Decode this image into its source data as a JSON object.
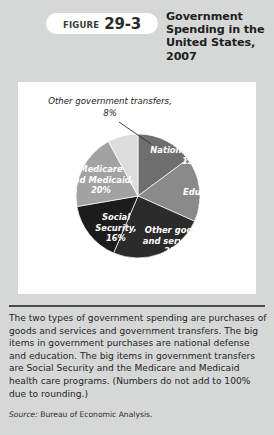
{
  "header": {
    "badge_word": "Figure",
    "badge_number": "29-3",
    "title": "Government Spending in the United States, 2007"
  },
  "chart_data": {
    "type": "pie",
    "title": "Government Spending in the United States, 2007",
    "legend": "none",
    "note": "Numbers do not add to 100% due to rounding.",
    "categories": [
      "National defense",
      "Education",
      "Other goods and services",
      "Social Security",
      "Medicare and Medicaid",
      "Other government transfers"
    ],
    "values": [
      15,
      17,
      25,
      16,
      20,
      8
    ],
    "slices": [
      {
        "name": "national-defense",
        "label": "National defense,",
        "value_label": "15%",
        "value": 15,
        "color": "#6e6e6e",
        "text_color": "#ffffff",
        "label_x": 174,
        "label_y": 71
      },
      {
        "name": "education",
        "label": "Education,",
        "value_label": "17%",
        "value": 17,
        "color": "#8a8a8a",
        "text_color": "#ffffff",
        "label_x": 190,
        "label_y": 113
      },
      {
        "name": "other-goods-and-services",
        "label": "Other goods",
        "label2": "and services,",
        "value_label": "25%",
        "value": 25,
        "color": "#2b2b2b",
        "text_color": "#ffffff",
        "label_x": 156,
        "label_y": 151
      },
      {
        "name": "social-security",
        "label": "Social",
        "label2": "Security,",
        "value_label": "16%",
        "value": 16,
        "color": "#1c1c1c",
        "text_color": "#ffffff",
        "label_x": 98,
        "label_y": 138
      },
      {
        "name": "medicare-and-medicaid",
        "label": "Medicare",
        "label2": "and Medicaid,",
        "value_label": "20%",
        "value": 20,
        "color": "#a2a2a2",
        "text_color": "#ffffff",
        "label_x": 83,
        "label_y": 90
      },
      {
        "name": "other-government-transfers",
        "label": "Other government transfers,",
        "value_label": "8%",
        "value": 8,
        "color": "#dcdcdc",
        "text_color": "#1d1d1d",
        "callout": true,
        "label_x": 92,
        "label_y": 22,
        "value_x": 92,
        "value_y": 34
      }
    ],
    "geometry": {
      "cx": 120,
      "cy": 114,
      "r": 62,
      "start_angle_deg": -90,
      "direction": "clockwise"
    }
  },
  "caption": {
    "text": "The two types of government spending are purchases of goods and services and government transfers. The big items in government purchases are national defense and education. The big items in government transfers are Social Security and the Medicare and Medicaid health care programs. (Numbers do not add to 100% due to rounding.)"
  },
  "source": {
    "keyword": "Source:",
    "text": "Bureau of Economic Analysis."
  }
}
